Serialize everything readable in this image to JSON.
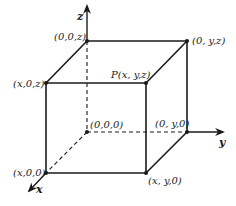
{
  "diagram": {
    "type": "3d-coordinate-box",
    "axes": {
      "x": {
        "label": "x"
      },
      "y": {
        "label": "y"
      },
      "z": {
        "label": "z"
      }
    },
    "points": {
      "origin": {
        "label": "(0,0,0)"
      },
      "z_point": {
        "label": "(0,0,z)"
      },
      "xz_point": {
        "label": "(x,0,z)"
      },
      "yz_point": {
        "label": "(0, y,z)"
      },
      "p_point": {
        "label": "P(x, y,z)"
      },
      "x_point": {
        "label": "(x,0,0)"
      },
      "y_point": {
        "label": "(0, y,0)"
      },
      "xy_point": {
        "label": "(x, y,0)"
      }
    },
    "colors": {
      "stroke": "#1a1a1a",
      "background": "#ffffff"
    }
  }
}
